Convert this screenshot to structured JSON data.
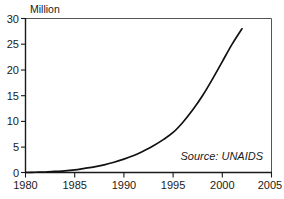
{
  "chart_data": {
    "type": "line",
    "title": "",
    "subtitle": "",
    "ylabel": "Million",
    "xlabel": "",
    "xlim": [
      1980,
      2005
    ],
    "ylim": [
      0,
      30
    ],
    "grid": false,
    "legend": null,
    "annotations": [
      {
        "name": "source-note",
        "text": "Source: UNAIDS",
        "position": "bottom-right-inside-plot",
        "style": "italic"
      }
    ],
    "yticks": [
      0,
      5,
      10,
      15,
      20,
      25,
      30
    ],
    "ytick_labels": [
      "0",
      "5",
      "10",
      "15",
      "20",
      "25",
      "30"
    ],
    "xticks": [
      1980,
      1985,
      1990,
      1995,
      2000,
      2005
    ],
    "xtick_labels": [
      "1980",
      "1985",
      "1990",
      "1995",
      "2000",
      "2005"
    ],
    "series": [
      {
        "name": "People living with HIV/AIDS",
        "color": "#111111",
        "x": [
          1980,
          1981,
          1982,
          1983,
          1984,
          1985,
          1986,
          1987,
          1988,
          1989,
          1990,
          1991,
          1992,
          1993,
          1994,
          1995,
          1996,
          1997,
          1998,
          1999,
          2000,
          2001,
          2002
        ],
        "values": [
          0.0,
          0.05,
          0.1,
          0.2,
          0.3,
          0.5,
          0.8,
          1.1,
          1.5,
          2.0,
          2.6,
          3.3,
          4.2,
          5.2,
          6.4,
          7.8,
          9.8,
          12.2,
          15.0,
          18.2,
          21.6,
          25.0,
          28.0
        ]
      }
    ]
  },
  "axis": {
    "ylabel_text": "Million",
    "source_text": "Source: UNAIDS"
  }
}
